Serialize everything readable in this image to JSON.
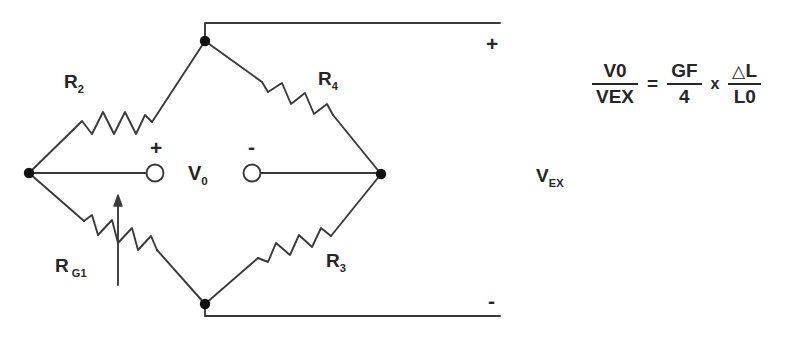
{
  "figure": {
    "type": "wheatstone-bridge-quarter-strain-gauge"
  },
  "components": {
    "r2": {
      "label": "R",
      "sub": "2",
      "name": "resistor-r2"
    },
    "r4": {
      "label": "R",
      "sub": "4",
      "name": "resistor-r4"
    },
    "r3": {
      "label": "R",
      "sub": "3",
      "name": "resistor-r3"
    },
    "rg1": {
      "label": "R",
      "sub": "G1",
      "name": "variable-resistor-rg1"
    }
  },
  "bridge": {
    "output_label": "V",
    "output_sub": "0",
    "output_plus": "+",
    "output_minus": "-",
    "excitation_label": "V",
    "excitation_sub": "EX",
    "supply_plus": "+",
    "supply_minus": "-"
  },
  "equation": {
    "lhs": {
      "numerator": "V",
      "numerator_sub": "0",
      "denominator": "V",
      "denominator_sub": "EX"
    },
    "equals": "=",
    "term1": {
      "numerator": "GF",
      "denominator": "4"
    },
    "times": "x",
    "term2": {
      "numerator_delta": "△",
      "numerator": "L",
      "denominator": "L",
      "denominator_sub": "0"
    },
    "plain_text": "V0 / VEX  =  GF / 4  x  ΔL / L0"
  },
  "colors": {
    "background": "#ffffff",
    "ink": "#262626",
    "wire": "#3a3a3a",
    "node": "#111111"
  }
}
